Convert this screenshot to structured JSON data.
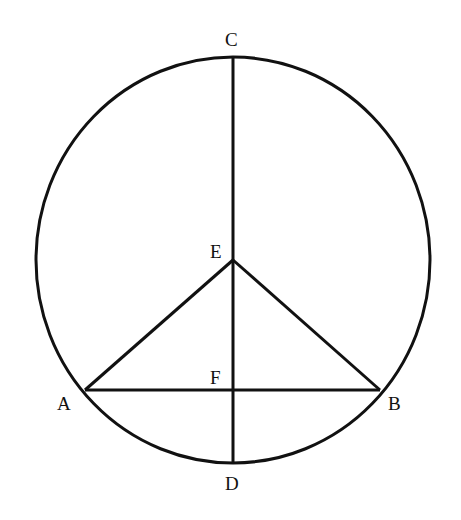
{
  "diagram": {
    "type": "geometry",
    "circle": {
      "cx": 233,
      "cy": 260,
      "rx": 197,
      "ry": 203
    },
    "points": {
      "A": {
        "label": "A",
        "x": 85,
        "y": 390
      },
      "B": {
        "label": "B",
        "x": 380,
        "y": 390
      },
      "C": {
        "label": "C",
        "x": 233,
        "y": 57
      },
      "D": {
        "label": "D",
        "x": 233,
        "y": 463
      },
      "E": {
        "label": "E",
        "x": 233,
        "y": 260
      },
      "F": {
        "label": "F",
        "x": 233,
        "y": 390
      }
    },
    "segments": [
      "CD",
      "AB",
      "EA",
      "EB"
    ],
    "stroke_color": "#111111"
  }
}
